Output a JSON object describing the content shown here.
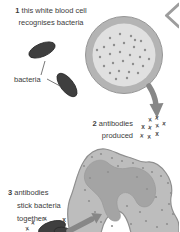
{
  "figure_type": "biology-immune-response-diagram",
  "steps": [
    {
      "number": "1",
      "lines": [
        "this white blood cell",
        "recognises bacteria"
      ]
    },
    {
      "number": "2",
      "lines": [
        "antibodies",
        "produced"
      ]
    },
    {
      "number": "3",
      "lines": [
        "antibodies",
        "stick bacteria",
        "together"
      ]
    }
  ],
  "callouts": {
    "bacteria_label": "bacteria"
  },
  "antibody": {
    "glyph": "x",
    "cluster2_count": 9,
    "cluster3_count": 4
  },
  "colors": {
    "background": "#ffffff",
    "text": "#3c3c3c",
    "bacterium": "#3f3f3f",
    "bacterium_edge": "#2b2b2b",
    "wbc_rim": "#b4b4b4",
    "wbc_edge": "#979797",
    "wbc_inner": "#e0e0e0",
    "wbc_dot": "#8d8d8d",
    "cell_body": "#bdbdbd",
    "cell_edge": "#8f8f8f",
    "cell_nucleus": "#a4a4a4",
    "cell_nucleus_edge": "#999999",
    "cell_dot": "#909090",
    "arrow": "#878787",
    "antibody_mark": "#4a4a4a",
    "chevron": "#9d9d9d",
    "pointer_line": "#555555"
  }
}
